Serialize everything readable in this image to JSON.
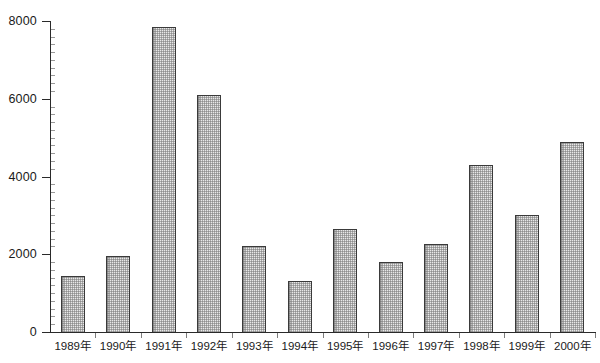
{
  "chart_data": {
    "type": "bar",
    "title": "",
    "subtitle": "",
    "xlabel": "",
    "ylabel": "",
    "ylim": [
      0,
      8000
    ],
    "ytick_values": [
      0,
      2000,
      4000,
      6000,
      8000
    ],
    "ytick_labels": [
      "0",
      "2000",
      "4000",
      "6000",
      "8000"
    ],
    "y_minor_step": 200,
    "grid": false,
    "legend": null,
    "legend_position": "none",
    "categories": [
      "1989年",
      "1990年",
      "1991年",
      "1992年",
      "1993年",
      "1994年",
      "1995年",
      "1996年",
      "1997年",
      "1998年",
      "1999年",
      "2000年"
    ],
    "values": [
      1450,
      1950,
      7850,
      6100,
      2200,
      1320,
      2650,
      1800,
      2270,
      4300,
      3000,
      4900
    ],
    "bar_style": {
      "fill": "#e8e8e8",
      "pattern": "fine-checker-dot",
      "border": "#3a3a3a"
    },
    "axis_color": "#2a2a2a",
    "background": "#ffffff"
  }
}
